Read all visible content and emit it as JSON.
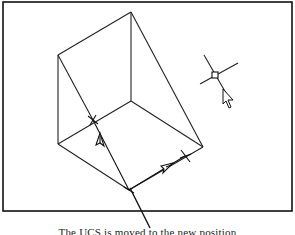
{
  "figure": {
    "frame": {
      "x": 3,
      "y": 2,
      "width": 289,
      "height": 209,
      "stroke": "#111111"
    },
    "colors": {
      "line": "#222222",
      "background": "#ffffff"
    },
    "wedge": {
      "vertices": {
        "top": [
          131,
          12
        ],
        "left_top": [
          58,
          55
        ],
        "left_bottom": [
          58,
          144
        ],
        "inner": [
          131,
          101
        ],
        "right": [
          203,
          147
        ],
        "bottom": [
          129,
          190
        ]
      },
      "edges": [
        [
          "top",
          "left_top"
        ],
        [
          "top",
          "inner"
        ],
        [
          "top",
          "right"
        ],
        [
          "left_top",
          "left_bottom"
        ],
        [
          "left_top",
          "bottom_via_diag"
        ],
        [
          "inner",
          "left_bottom"
        ],
        [
          "inner",
          "right"
        ],
        [
          "left_bottom",
          "bottom"
        ],
        [
          "right",
          "bottom"
        ]
      ]
    },
    "ucs_icon": {
      "origin": [
        129,
        190
      ],
      "y_axis_end": [
        93,
        120
      ],
      "x_axis_end": [
        185,
        156
      ],
      "cross_markers": [
        [
          93,
          120
        ],
        [
          185,
          156
        ]
      ]
    },
    "pick_cursor": {
      "crosshair_center": [
        215,
        75
      ],
      "arrow_tip": [
        222,
        92
      ]
    },
    "leader_line": {
      "from": [
        130,
        188
      ],
      "to": [
        150,
        228
      ]
    },
    "caption": "The UCS is moved to the new position"
  }
}
